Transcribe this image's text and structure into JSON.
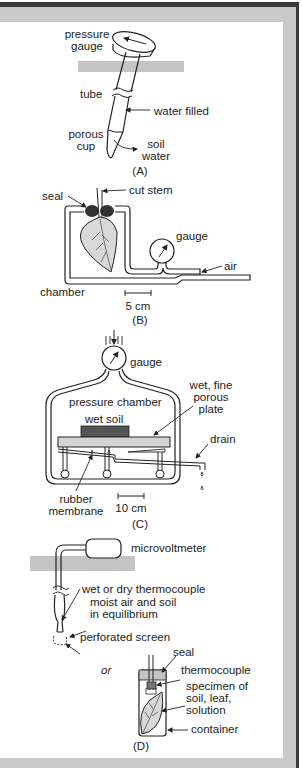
{
  "figure": {
    "panels": [
      {
        "id": "A",
        "caption": "(A)",
        "labels": {
          "pressure_gauge": [
            "pressure",
            "gauge"
          ],
          "tube": "tube",
          "water_filled": "water filled",
          "porous_cup": [
            "porous",
            "cup"
          ],
          "soil_water": [
            "soil",
            "water"
          ]
        }
      },
      {
        "id": "B",
        "caption": "(B)",
        "labels": {
          "seal": "seal",
          "cut_stem": "cut stem",
          "gauge": "gauge",
          "air": "air",
          "chamber": "chamber",
          "scale": "5 cm"
        }
      },
      {
        "id": "C",
        "caption": "(C)",
        "labels": {
          "gauge": "gauge",
          "pressure_chamber": "pressure chamber",
          "wet_fine_porous_plate": [
            "wet, fine",
            "porous",
            "plate"
          ],
          "wet_soil": "wet soil",
          "drain": "drain",
          "rubber_membrane": [
            "rubber",
            "membrane"
          ],
          "scale": "10 cm"
        }
      },
      {
        "id": "D",
        "caption": "(D)",
        "labels": {
          "microvoltmeter": "microvoltmeter",
          "wet_or_dry_thermocouple": "wet or dry thermocouple",
          "moist_air": [
            "moist air and soil",
            "in equilibrium"
          ],
          "perforated_screen": "perforated screen",
          "or": "or",
          "seal": "seal",
          "thermocouple": "thermocouple",
          "specimen": [
            "specimen of",
            "soil, leaf,",
            "solution"
          ],
          "container": "container"
        }
      }
    ],
    "colors": {
      "frame_dark": "#3a3a3a",
      "frame_gray": "#c9c9c9",
      "ground_gray": "#c4c4c4",
      "leaf_fill": "#d8d8d8",
      "soil_dark": "#555555",
      "plate_fill": "#d4d4d4",
      "seal_dark": "#333333"
    }
  }
}
